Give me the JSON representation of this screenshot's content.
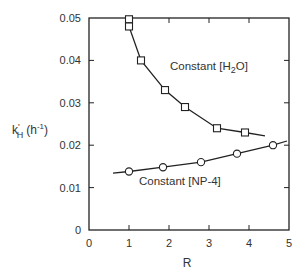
{
  "chart_data": {
    "type": "line",
    "title": "",
    "xlabel": "R",
    "ylabel": "k'H (h-1)",
    "ylabel_parts": {
      "main": "k",
      "prime": "'",
      "sub": "H",
      "unit_open": "(h",
      "unit_sup": "-1",
      "unit_close": ")"
    },
    "xlim": [
      0,
      5
    ],
    "ylim": [
      0,
      0.05
    ],
    "x_ticks": [
      0,
      1,
      2,
      3,
      4,
      5
    ],
    "x_tick_labels": [
      "0",
      "1",
      "2",
      "3",
      "4",
      "5"
    ],
    "y_ticks": [
      0,
      0.01,
      0.02,
      0.03,
      0.04,
      0.05
    ],
    "y_tick_labels": [
      "0",
      "0.01",
      "0.02",
      "0.03",
      "0.04",
      "0.05"
    ],
    "grid": false,
    "legend": "inline labels",
    "series": [
      {
        "name": "Constant [H2O]",
        "label_main": "Constant [H",
        "label_sub": "2",
        "label_end": "O]",
        "marker": "square",
        "x": [
          1.0,
          1.0,
          1.3,
          1.9,
          2.4,
          3.2,
          3.9
        ],
        "values": [
          0.0497,
          0.048,
          0.04,
          0.033,
          0.029,
          0.024,
          0.023
        ],
        "line_x": [
          1.0,
          1.0,
          1.3,
          1.9,
          2.4,
          3.2,
          3.9,
          4.4
        ],
        "line_y": [
          0.0497,
          0.048,
          0.04,
          0.033,
          0.029,
          0.024,
          0.023,
          0.0222
        ]
      },
      {
        "name": "Constant [NP-4]",
        "label_main": "Constant [NP-4]",
        "marker": "circle",
        "x": [
          1.0,
          1.85,
          2.8,
          3.7,
          4.6
        ],
        "values": [
          0.0138,
          0.0148,
          0.016,
          0.018,
          0.02
        ],
        "line_x": [
          0.6,
          1.0,
          1.85,
          2.8,
          3.7,
          4.6,
          4.95
        ],
        "line_y": [
          0.0134,
          0.0138,
          0.0148,
          0.016,
          0.018,
          0.02,
          0.021
        ]
      }
    ]
  }
}
